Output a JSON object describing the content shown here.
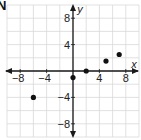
{
  "choice_label": "N",
  "chart_data": {
    "type": "scatter",
    "title": "",
    "xlabel": "x",
    "ylabel": "y",
    "xlim": [
      -10,
      10
    ],
    "ylim": [
      -10,
      10
    ],
    "grid": true,
    "grid_step": 2,
    "x_ticks": [
      -8,
      -4,
      4,
      8
    ],
    "x_tick_labels": [
      "−8",
      "−4",
      "4",
      "8"
    ],
    "y_ticks": [
      8,
      4,
      -4,
      -8
    ],
    "y_tick_labels": [
      "8",
      "4",
      "−4",
      "−8"
    ],
    "legend": null,
    "series": [
      {
        "name": "points",
        "points": [
          {
            "x": -6,
            "y": -4
          },
          {
            "x": 0,
            "y": -1
          },
          {
            "x": 2,
            "y": 0
          },
          {
            "x": 5,
            "y": 1.5
          },
          {
            "x": 7,
            "y": 2.5
          }
        ]
      }
    ]
  },
  "colors": {
    "grid": "#d9d9d9",
    "axis": "#1a1a1a",
    "point": "#111111",
    "text": "#222222"
  }
}
